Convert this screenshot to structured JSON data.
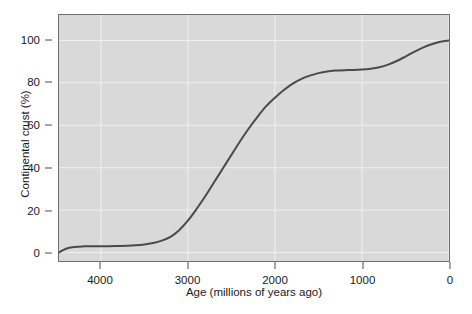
{
  "chart_data": {
    "type": "line",
    "title": "",
    "xlabel": "Age (millions of years ago)",
    "ylabel": "Continental crust (%)",
    "xlim": [
      4480,
      0
    ],
    "ylim": [
      -4,
      112
    ],
    "x_ticks": [
      4000,
      3000,
      2000,
      1000,
      0
    ],
    "x_tick_labels": [
      "4000",
      "3000",
      "2000",
      "1000",
      "0"
    ],
    "y_ticks": [
      0,
      20,
      40,
      60,
      80,
      100
    ],
    "y_tick_labels": [
      "0",
      "20",
      "40",
      "60",
      "80",
      "100"
    ],
    "x_axis_inverted": true,
    "grid": true,
    "grid_color": "#f0f0f0",
    "plot_background": "#d9d9d9",
    "line_color": "#4a4a4a",
    "line_width": 2,
    "legend": null,
    "series": [
      {
        "name": "Continental crust growth",
        "x": [
          4480,
          4400,
          4300,
          4200,
          4100,
          4000,
          3900,
          3800,
          3700,
          3600,
          3500,
          3400,
          3300,
          3200,
          3100,
          3000,
          2900,
          2800,
          2700,
          2600,
          2500,
          2400,
          2300,
          2200,
          2100,
          2000,
          1900,
          1800,
          1700,
          1600,
          1500,
          1400,
          1300,
          1200,
          1100,
          1000,
          900,
          800,
          700,
          600,
          500,
          400,
          300,
          200,
          100,
          0
        ],
        "y": [
          0.0,
          1.8,
          2.6,
          2.9,
          3.0,
          3.0,
          3.0,
          3.1,
          3.2,
          3.4,
          3.8,
          4.5,
          5.6,
          7.4,
          10.5,
          15.0,
          20.5,
          26.5,
          33.0,
          39.5,
          46.0,
          52.5,
          58.5,
          64.0,
          69.0,
          73.0,
          76.5,
          79.5,
          81.8,
          83.4,
          84.6,
          85.4,
          85.8,
          86.0,
          86.1,
          86.3,
          86.7,
          87.4,
          88.6,
          90.3,
          92.4,
          94.6,
          96.6,
          98.2,
          99.4,
          100.0
        ]
      }
    ]
  }
}
